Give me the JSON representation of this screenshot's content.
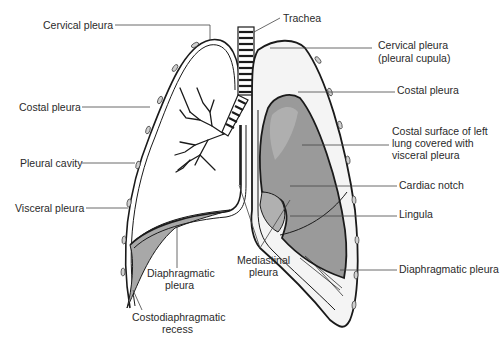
{
  "diagram": {
    "colors": {
      "background": "#ffffff",
      "outline": "#1a1a1a",
      "lung_fill": "#9a9a9a",
      "lung_fill_light": "#b8b8b8",
      "pleural_fill": "#f4f4f4",
      "recess_fill": "#a8a8a8",
      "label_text": "#2a2a2a"
    },
    "labels": {
      "trachea": "Trachea",
      "cervical_pleura_right": "Cervical pleura",
      "cervical_pleura_left_line1": "Cervical pleura",
      "cervical_pleura_left_line2": "(pleural cupula)",
      "costal_pleura_right": "Costal pleura",
      "costal_pleura_left": "Costal pleura",
      "costal_surface_line1": "Costal surface of left",
      "costal_surface_line2": "lung covered with",
      "costal_surface_line3": "visceral pleura",
      "pleural_cavity": "Pleural cavity",
      "visceral_pleura": "Visceral pleura",
      "cardiac_notch": "Cardiac notch",
      "lingula": "Lingula",
      "diaphragmatic_pleura_left": "Diaphragmatic pleura",
      "diaphragmatic_pleura_right_line1": "Diaphragmatic",
      "diaphragmatic_pleura_right_line2": "pleura",
      "mediastinal_pleura_line1": "Mediastinal",
      "mediastinal_pleura_line2": "pleura",
      "costodiaphragmatic_line1": "Costodiaphragmatic",
      "costodiaphragmatic_line2": "recess"
    }
  }
}
